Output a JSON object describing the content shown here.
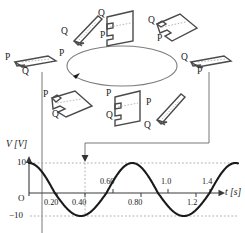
{
  "figure": {
    "rotation_arrow": "counterclockwise-arrow"
  },
  "coils": [
    {
      "id": "coil-top-left",
      "top_label": "Q",
      "bottom_label": "P",
      "orientation": "edge-on-tilted-left"
    },
    {
      "id": "coil-top-center",
      "top_label": "Q",
      "bottom_label": "P",
      "orientation": "face-on-front"
    },
    {
      "id": "coil-top-right",
      "top_label": "Q",
      "bottom_label": "P",
      "orientation": "oblique-right"
    },
    {
      "id": "coil-mid-left",
      "top_label": "P",
      "bottom_label": "Q",
      "orientation": "flat-horizontal"
    },
    {
      "id": "coil-mid-right",
      "top_label": "Q",
      "bottom_label": "P",
      "orientation": "flat-horizontal"
    },
    {
      "id": "coil-bottom-left",
      "top_label": "P",
      "bottom_label": "Q",
      "orientation": "oblique-left"
    },
    {
      "id": "coil-bottom-center",
      "top_label": "P",
      "bottom_label": "Q",
      "orientation": "face-on-front"
    },
    {
      "id": "coil-bottom-right",
      "top_label": "P",
      "bottom_label": "Q",
      "orientation": "edge-on-tilted-right"
    }
  ],
  "chart_axis": {
    "y_title": "V [V]",
    "x_title": "t [s]",
    "origin_label": "O",
    "y_top_label": "10",
    "y_bottom_label": "−10",
    "ticks_below": [
      "0.20",
      "0.40",
      "0.80",
      "1.2"
    ],
    "ticks_above": [
      "0.60",
      "1.0",
      "1.4"
    ]
  },
  "chart_data": {
    "type": "line",
    "title": "",
    "xlabel": "t [s]",
    "ylabel": "V [V]",
    "xlim": [
      0,
      1.62
    ],
    "ylim": [
      -10,
      10
    ],
    "grid": false,
    "legend": "none",
    "amplitude": 10,
    "period": 0.8,
    "equation": "V = 10 cos(2πt / 0.8)",
    "xticks": [
      0.2,
      0.4,
      0.6,
      0.8,
      1.0,
      1.2,
      1.4
    ],
    "xtick_labels": [
      "0.20",
      "0.40",
      "0.60",
      "0.80",
      "1.0",
      "1.2",
      "1.4"
    ],
    "yticks": [
      -10,
      10
    ],
    "ytick_labels": [
      "−10",
      "10"
    ],
    "x": [
      0.0,
      0.05,
      0.1,
      0.15,
      0.2,
      0.25,
      0.3,
      0.35,
      0.4,
      0.45,
      0.5,
      0.55,
      0.6,
      0.65,
      0.7,
      0.75,
      0.8,
      0.85,
      0.9,
      0.95,
      1.0,
      1.05,
      1.1,
      1.15,
      1.2,
      1.25,
      1.3,
      1.35,
      1.4,
      1.45,
      1.5,
      1.55,
      1.6
    ],
    "y": [
      10.0,
      9.24,
      7.07,
      3.83,
      0.0,
      -3.83,
      -7.07,
      -9.24,
      -10.0,
      -9.24,
      -7.07,
      -3.83,
      0.0,
      3.83,
      7.07,
      9.24,
      10.0,
      9.24,
      7.07,
      3.83,
      0.0,
      -3.83,
      -7.07,
      -9.24,
      -10.0,
      -9.24,
      -7.07,
      -3.83,
      0.0,
      3.83,
      7.07,
      9.24,
      10.0
    ],
    "annotations": [
      {
        "name": "peak-dashed-line",
        "value": 10,
        "style": "dotted-horizontal"
      },
      {
        "name": "trough-dashed-line",
        "value": -10,
        "style": "dotted-horizontal"
      },
      {
        "name": "minimum-marker",
        "x": 0.4,
        "style": "dashed-vertical-with-arrow"
      }
    ]
  },
  "colors": {
    "curve": "#1a1a1a",
    "axis": "#4a4a4a",
    "coil_outline": "#4a4a4a",
    "dashed": "#8a8a8a",
    "connector": "#6a6a6a"
  }
}
